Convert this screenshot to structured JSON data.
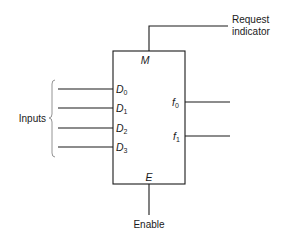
{
  "diagram": {
    "block": {
      "top_pin": {
        "letter": "M"
      },
      "bottom_pin": {
        "letter": "E"
      },
      "inputs": [
        {
          "letter": "D",
          "sub": "0"
        },
        {
          "letter": "D",
          "sub": "1"
        },
        {
          "letter": "D",
          "sub": "2"
        },
        {
          "letter": "D",
          "sub": "3"
        }
      ],
      "outputs": [
        {
          "letter": "f",
          "sub": "0"
        },
        {
          "letter": "f",
          "sub": "1"
        }
      ]
    },
    "labels": {
      "request_line1": "Request",
      "request_line2": "indicator",
      "inputs": "Inputs",
      "enable": "Enable"
    },
    "colors": {
      "line": "#1a1a1a",
      "brace": "#888888",
      "background": "#ffffff"
    }
  }
}
